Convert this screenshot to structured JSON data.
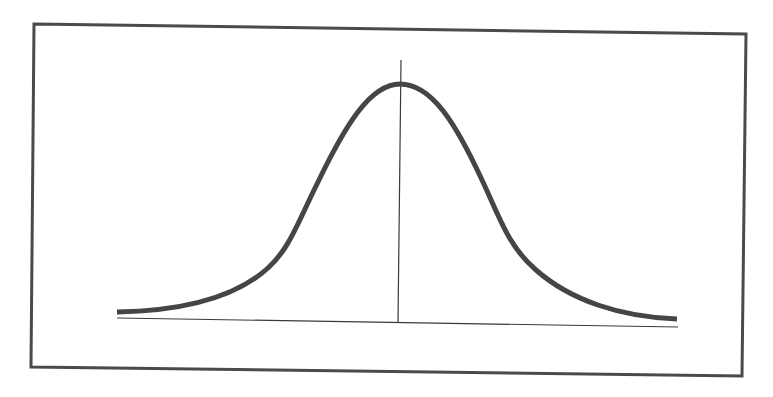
{
  "diagram": {
    "title": "",
    "type": "normal-distribution-bell-curve",
    "labels": []
  },
  "colors": {
    "background": "#ffffff",
    "frame": "#4a4a4a",
    "curve": "#454545",
    "axis": "#3a3a3a"
  },
  "geometry": {
    "frame": {
      "points": "34,24 746,34 742,376 31,367",
      "stroke_width": 3
    },
    "baseline": {
      "x1": 117,
      "y1": 318,
      "x2": 678,
      "y2": 327,
      "stroke_width": 1.2
    },
    "center_line": {
      "x1": 401,
      "y1": 60,
      "x2": 398,
      "y2": 323,
      "stroke_width": 1.2
    },
    "curve": {
      "path": "M117,312 C180,311 235,298 268,268 C290,248 298,222 318,182 C345,126 370,84 400,84 C432,84 456,124 482,180 C500,218 508,246 536,270 C570,300 620,317 677,319",
      "stroke_width": 5
    }
  }
}
